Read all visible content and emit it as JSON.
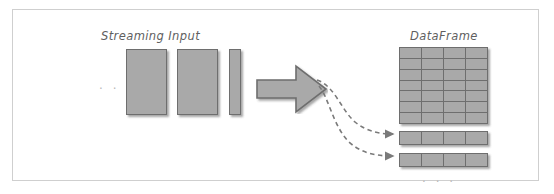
{
  "figure": {
    "title_left": "Streaming Input",
    "title_right": "DataFrame",
    "ellipsis_left": ". . .",
    "ellipsis_bottom": ". . .",
    "colors": {
      "block_fill": "#a9a9a9",
      "block_stroke": "#6e6e6e",
      "frame_border": "#cfcfcf",
      "background": "#ffffff",
      "label_text": "#5f5f5f",
      "ellipsis_text": "#b9b9b9",
      "dashed_arrow": "#7a7a7a"
    },
    "streaming_blocks": [
      {
        "name": "batch-block-1",
        "width": 41,
        "height": 66
      },
      {
        "name": "batch-block-2",
        "width": 41,
        "height": 66
      },
      {
        "name": "batch-block-3",
        "width": 12,
        "height": 66
      }
    ],
    "transform_arrow": {
      "name": "transform-arrow",
      "direction": "right"
    },
    "dataframe": {
      "grid_rows": 7,
      "grid_cols": 4,
      "appended_rows": [
        {
          "name": "appended-row-1",
          "cols": 4
        },
        {
          "name": "appended-row-2",
          "cols": 4
        }
      ]
    },
    "dashed_connectors": [
      {
        "name": "dashed-connector-1",
        "from": "transform-arrow",
        "to": "appended-row-1"
      },
      {
        "name": "dashed-connector-2",
        "from": "transform-arrow",
        "to": "appended-row-2"
      }
    ]
  }
}
